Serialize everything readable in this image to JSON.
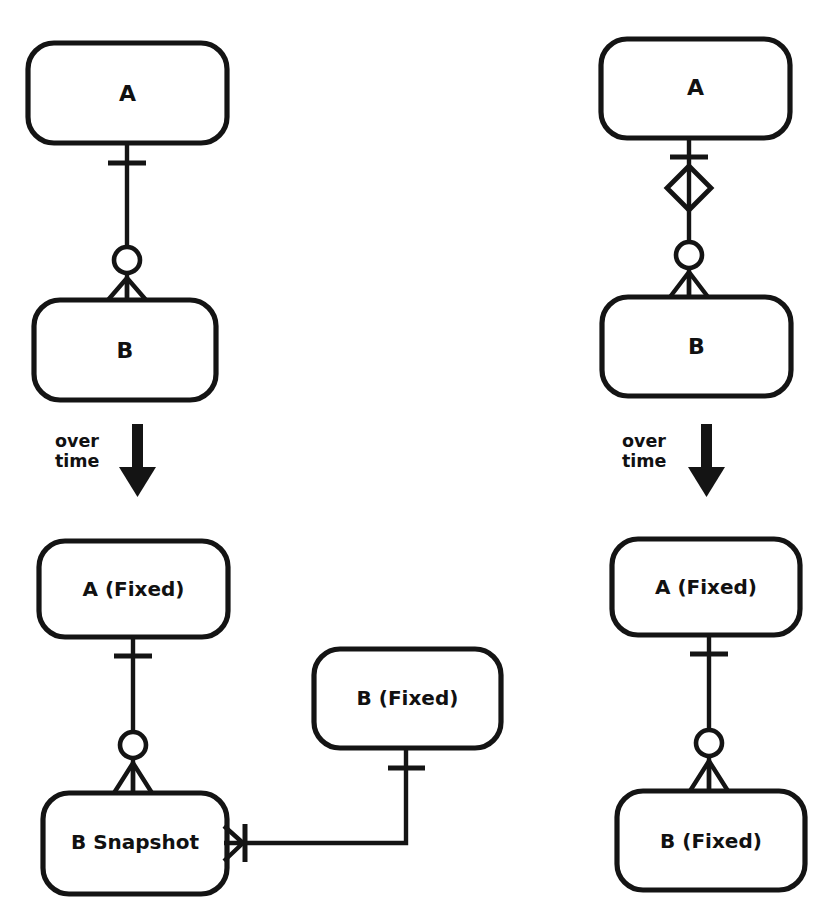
{
  "diagram": {
    "notation": "crow's-foot",
    "background_color": "#ffffff",
    "ink_color": "#141414",
    "columns": [
      {
        "id": "left-column",
        "name": "Snapshot approach",
        "before": {
          "entities": [
            {
              "id": "left-before-a",
              "label": "A"
            },
            {
              "id": "left-before-b",
              "label": "B"
            }
          ],
          "relationships": [
            {
              "id": "left-before-a-b",
              "from": "A",
              "to": "B",
              "from_cardinality": "one",
              "to_cardinality": "zero-or-many",
              "markers": [
                "tick",
                "ring",
                "crow-foot"
              ]
            }
          ]
        },
        "transition": {
          "id": "left-over-time",
          "line1": "over",
          "line2": "time",
          "arrow": "down-arrow-icon"
        },
        "after": {
          "entities": [
            {
              "id": "left-after-a-fixed",
              "label": "A (Fixed)"
            },
            {
              "id": "left-after-b-snapshot",
              "label": "B Snapshot"
            },
            {
              "id": "left-after-b-fixed",
              "label": "B (Fixed)"
            }
          ],
          "relationships": [
            {
              "id": "left-after-a-snapshot",
              "from": "A (Fixed)",
              "to": "B Snapshot",
              "from_cardinality": "one",
              "to_cardinality": "zero-or-many",
              "markers": [
                "tick",
                "ring",
                "crow-foot"
              ]
            },
            {
              "id": "left-after-bfixed-snapshot",
              "from": "B (Fixed)",
              "to": "B Snapshot",
              "from_cardinality": "one",
              "to_cardinality": "many",
              "markers": [
                "tick",
                "crow-foot",
                "tick"
              ],
              "routing": "elbow"
            }
          ]
        }
      },
      {
        "id": "right-column",
        "name": "Fixed (immutable) approach",
        "before": {
          "entities": [
            {
              "id": "right-before-a",
              "label": "A"
            },
            {
              "id": "right-before-b",
              "label": "B"
            }
          ],
          "relationships": [
            {
              "id": "right-before-a-b",
              "from": "A",
              "to": "B",
              "from_cardinality": "one",
              "to_cardinality": "zero-or-many",
              "markers": [
                "tick",
                "diamond",
                "ring",
                "crow-foot"
              ]
            }
          ]
        },
        "transition": {
          "id": "right-over-time",
          "line1": "over",
          "line2": "time",
          "arrow": "down-arrow-icon"
        },
        "after": {
          "entities": [
            {
              "id": "right-after-a-fixed",
              "label": "A (Fixed)"
            },
            {
              "id": "right-after-b-fixed",
              "label": "B (Fixed)"
            }
          ],
          "relationships": [
            {
              "id": "right-after-a-b",
              "from": "A (Fixed)",
              "to": "B (Fixed)",
              "from_cardinality": "one",
              "to_cardinality": "zero-or-many",
              "markers": [
                "tick",
                "ring",
                "crow-foot"
              ]
            }
          ]
        }
      }
    ]
  },
  "labels": {
    "left_before_a": "A",
    "left_before_b": "B",
    "left_over": "over",
    "left_time": "time",
    "left_after_a": "A (Fixed)",
    "left_after_snapshot": "B Snapshot",
    "left_after_bfixed": "B (Fixed)",
    "right_before_a": "A",
    "right_before_b": "B",
    "right_over": "over",
    "right_time": "time",
    "right_after_a": "A (Fixed)",
    "right_after_b": "B (Fixed)"
  }
}
